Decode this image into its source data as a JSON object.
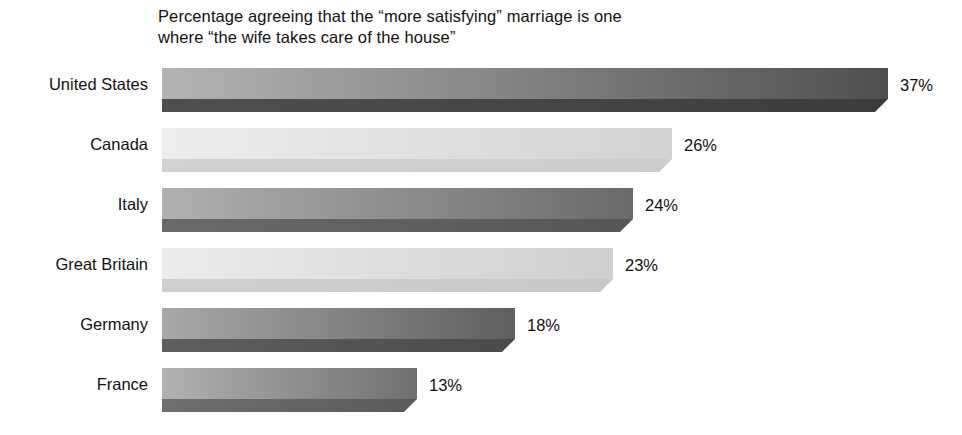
{
  "chart_data": {
    "type": "bar",
    "orientation": "horizontal",
    "title": "Percentage agreeing that the “more satisfying” marriage is one where “the wife takes care of the house”",
    "title_lines": [
      "Percentage agreeing that the “more satisfying” marriage is one",
      "where “the wife takes care of the house”"
    ],
    "categories": [
      "United States",
      "Canada",
      "Italy",
      "Great Britain",
      "Germany",
      "France"
    ],
    "values": [
      37,
      26,
      24,
      23,
      18,
      13
    ],
    "value_labels": [
      "37%",
      "26%",
      "24%",
      "23%",
      "18%",
      "13%"
    ],
    "unit": "%",
    "xlabel": "",
    "ylabel": "",
    "xlim": [
      0,
      37
    ],
    "grid": false,
    "legend": false,
    "style": "3d-beveled-horizontal-bars",
    "bars": [
      {
        "category": "United States",
        "value": 37,
        "label": "37%",
        "length_px": 726,
        "top_face_light": "#b4b4b4",
        "top_face_dark": "#4f4f4f",
        "side_face": "#3c3c3c"
      },
      {
        "category": "Canada",
        "value": 26,
        "label": "26%",
        "length_px": 510,
        "top_face_light": "#eeeeee",
        "top_face_dark": "#d2d2d2",
        "side_face": "#cccccc"
      },
      {
        "category": "Italy",
        "value": 24,
        "label": "24%",
        "length_px": 471,
        "top_face_light": "#b0b0b0",
        "top_face_dark": "#6a6a6a",
        "side_face": "#555555"
      },
      {
        "category": "Great Britain",
        "value": 23,
        "label": "23%",
        "length_px": 451,
        "top_face_light": "#ececec",
        "top_face_dark": "#cfcfcf",
        "side_face": "#c8c8c8"
      },
      {
        "category": "Germany",
        "value": 18,
        "label": "18%",
        "length_px": 353,
        "top_face_light": "#a8a8a8",
        "top_face_dark": "#5f5f5f",
        "side_face": "#4a4a4a"
      },
      {
        "category": "France",
        "value": 13,
        "label": "13%",
        "length_px": 255,
        "top_face_light": "#b2b2b2",
        "top_face_dark": "#6f6f6f",
        "side_face": "#5a5a5a"
      }
    ],
    "colors": {
      "background": "#ffffff",
      "text": "#111111"
    }
  }
}
